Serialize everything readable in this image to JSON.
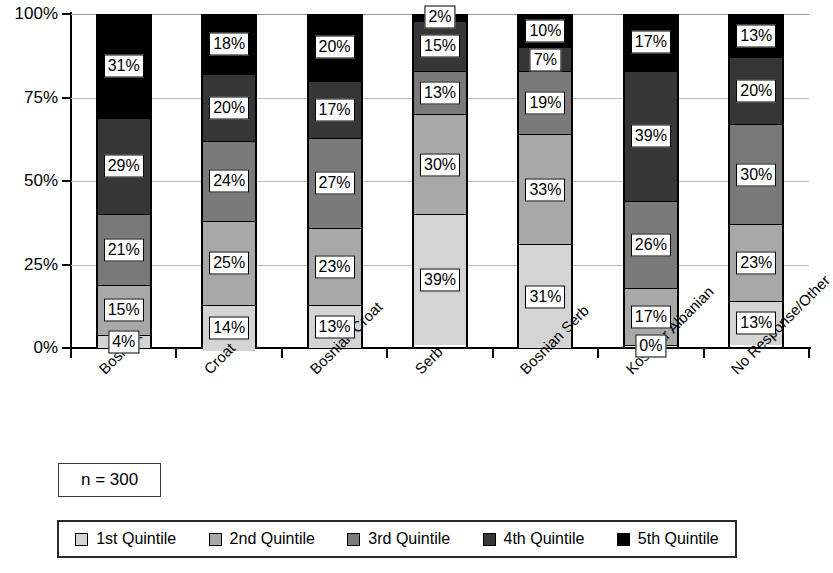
{
  "chart_data": {
    "type": "bar",
    "subtype": "stacked-percentage",
    "title": "",
    "xlabel": "",
    "ylabel": "",
    "ylim": [
      0,
      100
    ],
    "ytick_labels": [
      "0%",
      "25%",
      "50%",
      "75%",
      "100%"
    ],
    "ytick_values": [
      0,
      25,
      50,
      75,
      100
    ],
    "grid": true,
    "legend_position": "bottom",
    "annotation": "n = 300",
    "categories": [
      "Bosniak",
      "Croat",
      "Bosnian Croat",
      "Serb",
      "Bosnian Serb",
      "Kosovar Albanian",
      "No Response/Other"
    ],
    "series": [
      {
        "name": "1st Quintile",
        "color": "#d4d4d4",
        "values": [
          4,
          14,
          13,
          39,
          31,
          0,
          13
        ]
      },
      {
        "name": "2nd Quintile",
        "color": "#a8a8a8",
        "values": [
          15,
          25,
          23,
          30,
          33,
          17,
          23
        ]
      },
      {
        "name": "3rd Quintile",
        "color": "#7a7a7a",
        "values": [
          21,
          24,
          27,
          13,
          19,
          26,
          30
        ]
      },
      {
        "name": "4th Quintile",
        "color": "#363636",
        "values": [
          29,
          20,
          17,
          15,
          7,
          39,
          20
        ]
      },
      {
        "name": "5th Quintile",
        "color": "#000000",
        "values": [
          31,
          18,
          20,
          2,
          10,
          17,
          13
        ]
      }
    ],
    "data_labels": [
      [
        "4%",
        "15%",
        "21%",
        "29%",
        "31%"
      ],
      [
        "14%",
        "25%",
        "24%",
        "20%",
        "18%"
      ],
      [
        "13%",
        "23%",
        "27%",
        "17%",
        "20%"
      ],
      [
        "39%",
        "30%",
        "13%",
        "15%",
        "2%"
      ],
      [
        "31%",
        "33%",
        "19%",
        "7%",
        "10%"
      ],
      [
        "0%",
        "17%",
        "26%",
        "39%",
        "17%"
      ],
      [
        "13%",
        "23%",
        "30%",
        "20%",
        "13%"
      ]
    ]
  },
  "legend": {
    "items": [
      {
        "label": "1st Quintile",
        "color": "#d4d4d4"
      },
      {
        "label": "2nd Quintile",
        "color": "#a8a8a8"
      },
      {
        "label": "3rd Quintile",
        "color": "#7a7a7a"
      },
      {
        "label": "4th Quintile",
        "color": "#363636"
      },
      {
        "label": "5th Quintile",
        "color": "#000000"
      }
    ]
  },
  "sample_note": {
    "text": "n = 300"
  }
}
